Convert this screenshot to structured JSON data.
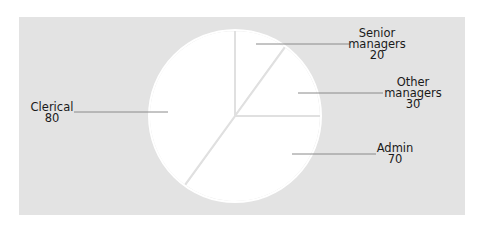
{
  "chart_data": {
    "type": "pie",
    "title": "",
    "start_angle_deg": 0,
    "direction": "clockwise",
    "slices": [
      {
        "label": "Senior managers",
        "value": 20
      },
      {
        "label": "Other managers",
        "value": 30
      },
      {
        "label": "Admin",
        "value": 70
      },
      {
        "label": "Clerical",
        "value": 80
      }
    ],
    "categories": [
      "Senior managers",
      "Other managers",
      "Admin",
      "Clerical"
    ],
    "values": [
      20,
      30,
      70,
      80
    ],
    "legend": "none (leader-line labels)"
  },
  "labels": {
    "senior": {
      "line1": "Senior",
      "line2": "managers",
      "value": "20"
    },
    "other": {
      "line1": "Other",
      "line2": "managers",
      "value": "30"
    },
    "admin": {
      "line1": "Admin",
      "value": "70"
    },
    "clerical": {
      "line1": "Clerical",
      "value": "80"
    }
  },
  "colors": {
    "panel_bg": "#e3e3e3",
    "slice_fill": "#ffffff",
    "slice_divider": "#e0e0e0",
    "leader_line": "#8a8a8a",
    "text": "#1a1a1a"
  }
}
